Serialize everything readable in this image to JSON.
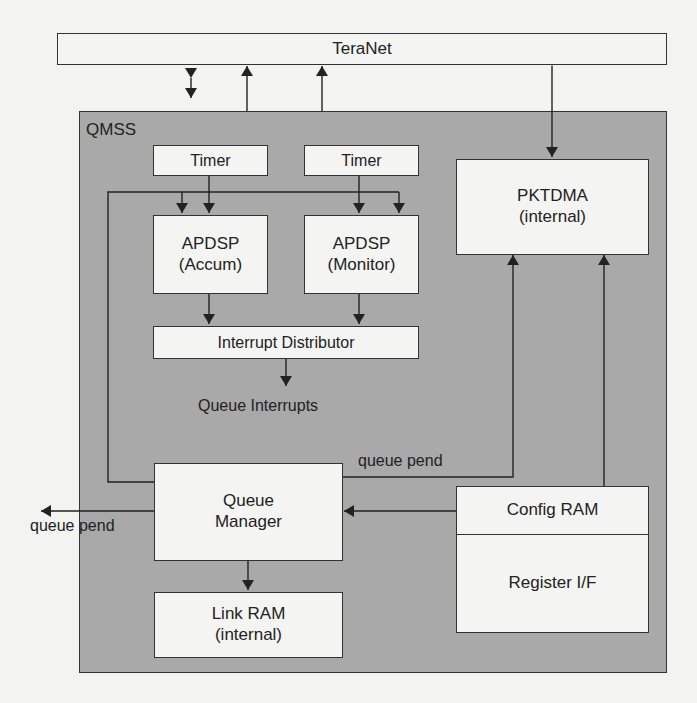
{
  "diagram": {
    "title": "TeraNet",
    "container": {
      "label": "QMSS",
      "fill": "#a9a9a9"
    },
    "blocks": {
      "teranet": {
        "label": "TeraNet"
      },
      "timer_1": {
        "label": "Timer"
      },
      "timer_2": {
        "label": "Timer"
      },
      "apdsp_accum": {
        "line1": "APDSP",
        "line2": "(Accum)"
      },
      "apdsp_monitor": {
        "line1": "APDSP",
        "line2": "(Monitor)"
      },
      "interrupt_distributor": {
        "label": "Interrupt Distributor"
      },
      "pktdma": {
        "line1": "PKTDMA",
        "line2": "(internal)"
      },
      "queue_manager": {
        "line1": "Queue",
        "line2": "Manager"
      },
      "link_ram": {
        "line1": "Link RAM",
        "line2": "(internal)"
      },
      "config_ram": {
        "label": "Config RAM"
      },
      "register_if": {
        "label": "Register I/F"
      }
    },
    "labels": {
      "queue_interrupts": "Queue Interrupts",
      "queue_pend_internal": "queue pend",
      "queue_pend_external": "queue pend"
    },
    "connections": [
      {
        "from": "Queue Manager",
        "to": "TeraNet",
        "type": "bidirectional"
      },
      {
        "from": "APDSP (Accum)",
        "to": "TeraNet",
        "type": "arrow"
      },
      {
        "from": "APDSP (Monitor)",
        "to": "TeraNet",
        "type": "arrow"
      },
      {
        "from": "TeraNet",
        "to": "PKTDMA",
        "type": "bidirectional"
      },
      {
        "from": "Timer",
        "to": "APDSP (Accum)",
        "type": "arrow"
      },
      {
        "from": "Timer",
        "to": "APDSP (Monitor)",
        "type": "arrow"
      },
      {
        "from": "Queue Manager",
        "to": "APDSP (Accum)",
        "type": "arrow"
      },
      {
        "from": "Queue Manager",
        "to": "APDSP (Monitor)",
        "type": "arrow"
      },
      {
        "from": "APDSP (Accum)",
        "to": "Interrupt Distributor",
        "type": "arrow"
      },
      {
        "from": "APDSP (Monitor)",
        "to": "Interrupt Distributor",
        "type": "arrow"
      },
      {
        "from": "Interrupt Distributor",
        "to": "Queue Interrupts",
        "type": "arrow"
      },
      {
        "from": "Queue Manager",
        "to": "PKTDMA",
        "type": "arrow",
        "label": "queue pend"
      },
      {
        "from": "Config RAM",
        "to": "PKTDMA",
        "type": "arrow"
      },
      {
        "from": "Config RAM",
        "to": "Queue Manager",
        "type": "arrow"
      },
      {
        "from": "Queue Manager",
        "to": "external",
        "type": "arrow",
        "label": "queue pend"
      },
      {
        "from": "Queue Manager",
        "to": "Link RAM",
        "type": "arrow"
      }
    ]
  }
}
